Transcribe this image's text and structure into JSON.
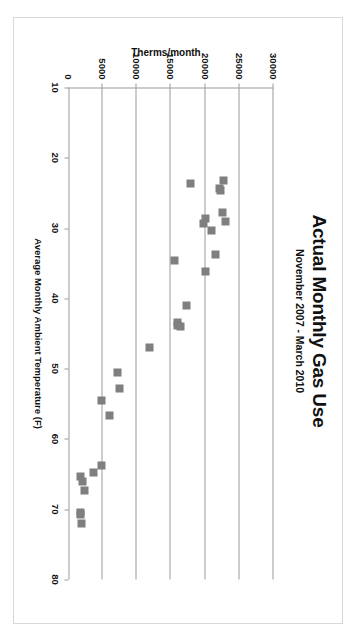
{
  "chart_data": {
    "type": "scatter",
    "title": "Actual Monthly Gas Use",
    "subtitle": "November 2007 - March 2010",
    "xlabel": "Average Monthly Ambient Temperature (F)",
    "ylabel": "Therms/month",
    "xlim": [
      10,
      80
    ],
    "ylim": [
      0,
      30000
    ],
    "xticks": [
      10,
      20,
      30,
      40,
      50,
      60,
      70,
      80
    ],
    "yticks": [
      0,
      5000,
      10000,
      15000,
      20000,
      25000,
      30000
    ],
    "xtick_labels": [
      "10",
      "20",
      "30",
      "40",
      "50",
      "60",
      "70",
      "80"
    ],
    "ytick_labels": [
      "0",
      "5000",
      "10000",
      "15000",
      "20000",
      "25000",
      "30000"
    ],
    "grid": "vertical-gridlines-at-yticks",
    "legend": "none",
    "marker_color": "#7f7f7f",
    "marker_shape": "square",
    "series": [
      {
        "name": "Monthly gas use",
        "points": [
          [
            23.2,
            22700
          ],
          [
            23.6,
            17900
          ],
          [
            24.4,
            22100
          ],
          [
            24.6,
            22300
          ],
          [
            27.8,
            22500
          ],
          [
            28.6,
            20100
          ],
          [
            29.0,
            23000
          ],
          [
            29.4,
            19700
          ],
          [
            30.4,
            21000
          ],
          [
            33.8,
            21500
          ],
          [
            34.6,
            15500
          ],
          [
            36.2,
            20000
          ],
          [
            41.0,
            17200
          ],
          [
            43.4,
            15900
          ],
          [
            43.8,
            16000
          ],
          [
            44.0,
            16400
          ],
          [
            47.0,
            11800
          ],
          [
            50.6,
            7200
          ],
          [
            52.8,
            7400
          ],
          [
            54.6,
            4900
          ],
          [
            56.6,
            6000
          ],
          [
            63.8,
            4900
          ],
          [
            64.8,
            3600
          ],
          [
            65.4,
            1700
          ],
          [
            66.0,
            2100
          ],
          [
            67.4,
            2300
          ],
          [
            70.4,
            1800
          ],
          [
            70.8,
            1800
          ],
          [
            72.0,
            1900
          ]
        ]
      }
    ]
  }
}
